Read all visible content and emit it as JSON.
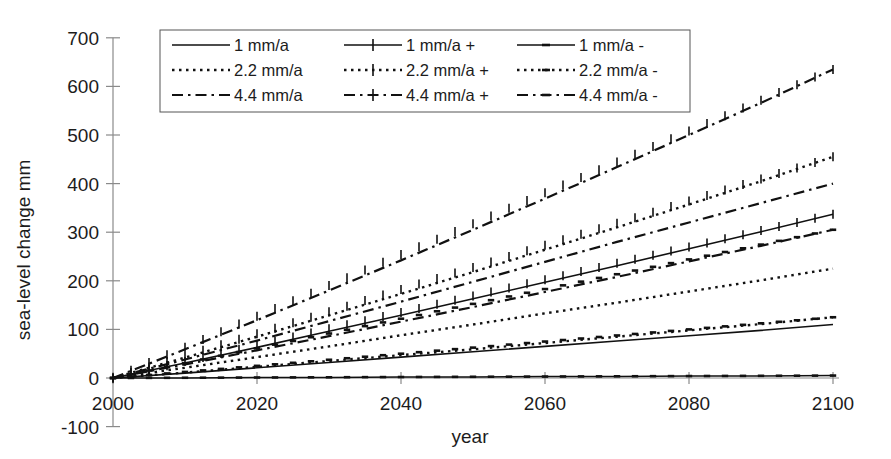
{
  "chart_data": {
    "type": "line",
    "title": "",
    "xlabel": "year",
    "ylabel": "sea-level change  mm",
    "xlim": [
      2000,
      2100
    ],
    "ylim": [
      -100,
      700
    ],
    "x_ticks": [
      2000,
      2020,
      2040,
      2060,
      2080,
      2100
    ],
    "y_ticks": [
      -100,
      0,
      100,
      200,
      300,
      400,
      500,
      600,
      700
    ],
    "grid": false,
    "legend_position": "top-center-inside",
    "legend_columns": 3,
    "legend_rows": 3,
    "x": [
      2000,
      2010,
      2020,
      2030,
      2040,
      2050,
      2060,
      2070,
      2080,
      2090,
      2100
    ],
    "series": [
      {
        "name": "1 mm/a",
        "label": "1 mm/a",
        "style": "solid",
        "marker": "none",
        "values": [
          0,
          10,
          21,
          32,
          43,
          54,
          65,
          76,
          87,
          98,
          110
        ],
        "end_value": 110
      },
      {
        "name": "2.2 mm/a",
        "label": "2.2 mm/a",
        "style": "dotted",
        "marker": "none",
        "values": [
          0,
          21,
          43,
          65,
          88,
          110,
          133,
          155,
          178,
          201,
          225
        ],
        "end_value": 225
      },
      {
        "name": "4.4 mm/a",
        "label": "4.4 mm/a",
        "style": "dashdot",
        "marker": "none",
        "values": [
          0,
          38,
          77,
          117,
          157,
          198,
          239,
          280,
          320,
          360,
          400
        ],
        "end_value": 400
      },
      {
        "name": "1 mm/a +",
        "label": "1 mm/a +",
        "style": "solid",
        "marker": "plus",
        "values": [
          0,
          31,
          63,
          96,
          129,
          163,
          197,
          231,
          266,
          301,
          337
        ],
        "end_value": 337
      },
      {
        "name": "2.2 mm/a +",
        "label": "2.2 mm/a +",
        "style": "dotted",
        "marker": "plus",
        "values": [
          0,
          42,
          85,
          129,
          173,
          218,
          264,
          310,
          357,
          405,
          455
        ],
        "end_value": 455
      },
      {
        "name": "4.4 mm/a +",
        "label": "4.4 mm/a +",
        "style": "dashdot",
        "marker": "plus",
        "values": [
          0,
          59,
          119,
          180,
          242,
          305,
          369,
          434,
          500,
          566,
          635
        ],
        "end_value": 635
      },
      {
        "name": "1 mm/a -",
        "label": "1 mm/a -",
        "style": "solid",
        "marker": "dash",
        "values": [
          0,
          0,
          1,
          1,
          2,
          2,
          3,
          3,
          4,
          4,
          5
        ],
        "end_value": 5
      },
      {
        "name": "2.2 mm/a -",
        "label": "2.2 mm/a -",
        "style": "dotted",
        "marker": "dash",
        "values": [
          0,
          11,
          23,
          35,
          47,
          59,
          72,
          85,
          98,
          111,
          125
        ],
        "end_value": 125
      },
      {
        "name": "4.4 mm/a -",
        "label": "4.4 mm/a -",
        "style": "dashdot",
        "marker": "dash",
        "values": [
          0,
          28,
          57,
          86,
          116,
          146,
          177,
          208,
          240,
          272,
          305
        ],
        "end_value": 305
      }
    ],
    "legend_entries": [
      {
        "label": "1 mm/a",
        "style": "solid",
        "marker": "none"
      },
      {
        "label": "1 mm/a +",
        "style": "solid",
        "marker": "plus"
      },
      {
        "label": "1 mm/a -",
        "style": "solid",
        "marker": "dash"
      },
      {
        "label": "2.2 mm/a",
        "style": "dotted",
        "marker": "none"
      },
      {
        "label": "2.2 mm/a +",
        "style": "dotted",
        "marker": "plus"
      },
      {
        "label": "2.2 mm/a -",
        "style": "dotted",
        "marker": "dash"
      },
      {
        "label": "4.4 mm/a",
        "style": "dashdot",
        "marker": "none"
      },
      {
        "label": "4.4 mm/a +",
        "style": "dashdot",
        "marker": "plus"
      },
      {
        "label": "4.4 mm/a -",
        "style": "dashdot",
        "marker": "dash"
      }
    ],
    "colors": {
      "line": "#111111",
      "axis": "#8a8a8a",
      "text": "#1c1c1c",
      "background": "#ffffff"
    }
  }
}
